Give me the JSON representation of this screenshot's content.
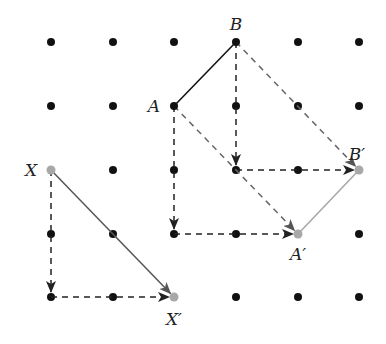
{
  "diagram": {
    "type": "translation-on-dot-grid",
    "grid": {
      "columns_x": [
        51,
        113,
        174,
        236,
        298,
        359
      ],
      "rows_y": [
        42,
        106,
        170,
        234,
        297
      ],
      "dot_color": "#111111",
      "dot_radius": 4
    },
    "colors": {
      "original": "#111111",
      "image": "#a8a8a8",
      "path_arrow": "#222222",
      "diagonal_arrow": "#555555",
      "dashed_diagonal": "#666666"
    },
    "points": [
      {
        "id": "B",
        "label": "B",
        "col": 3,
        "row": 0,
        "kind": "original",
        "label_dx": 0,
        "label_dy": -12,
        "anchor": "middle"
      },
      {
        "id": "A",
        "label": "A",
        "col": 2,
        "row": 1,
        "kind": "original",
        "label_dx": -14,
        "label_dy": 6,
        "anchor": "end"
      },
      {
        "id": "X",
        "label": "X",
        "col": 0,
        "row": 2,
        "kind": "image",
        "label_dx": -14,
        "label_dy": 6,
        "anchor": "end"
      },
      {
        "id": "Bp",
        "label": "B′",
        "col": 5,
        "row": 2,
        "kind": "image",
        "label_dx": -2,
        "label_dy": -10,
        "anchor": "middle"
      },
      {
        "id": "Ap",
        "label": "A′",
        "col": 4,
        "row": 3,
        "kind": "image",
        "label_dx": 0,
        "label_dy": 26,
        "anchor": "middle"
      },
      {
        "id": "Xp",
        "label": "X′",
        "col": 2,
        "row": 4,
        "kind": "image",
        "label_dx": 0,
        "label_dy": 28,
        "anchor": "middle"
      }
    ],
    "segments": [
      {
        "from": "A",
        "to": "B",
        "style": "solid",
        "color": "original"
      },
      {
        "from": "Ap",
        "to": "Bp",
        "style": "solid",
        "color": "image"
      }
    ],
    "arrows": [
      {
        "from": [
          3,
          0
        ],
        "to": [
          3,
          2
        ],
        "style": "dashed",
        "color": "path_arrow"
      },
      {
        "from": [
          3,
          2
        ],
        "to": [
          5,
          2
        ],
        "style": "dashed",
        "color": "path_arrow"
      },
      {
        "from": [
          2,
          1
        ],
        "to": [
          2,
          3
        ],
        "style": "dashed",
        "color": "path_arrow"
      },
      {
        "from": [
          2,
          3
        ],
        "to": [
          4,
          3
        ],
        "style": "dashed",
        "color": "path_arrow"
      },
      {
        "from": [
          0,
          2
        ],
        "to": [
          0,
          4
        ],
        "style": "dashed",
        "color": "path_arrow"
      },
      {
        "from": [
          0,
          4
        ],
        "to": [
          2,
          4
        ],
        "style": "dashed",
        "color": "path_arrow"
      },
      {
        "from": [
          3,
          0
        ],
        "to": [
          5,
          2
        ],
        "style": "dashed",
        "color": "dashed_diagonal"
      },
      {
        "from": [
          2,
          1
        ],
        "to": [
          4,
          3
        ],
        "style": "dashed",
        "color": "dashed_diagonal"
      },
      {
        "from": [
          0,
          2
        ],
        "to": [
          2,
          4
        ],
        "style": "solid",
        "color": "diagonal_arrow"
      }
    ]
  }
}
